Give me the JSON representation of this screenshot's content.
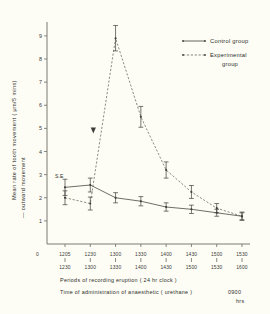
{
  "figure": {
    "background_color": "#fdfdf5",
    "axis_color": "#6b6b66"
  },
  "axes": {
    "y_title_line1": "Mean  rate  of  tooth  movement  (  μm/5  mins)",
    "y_title_line2": "— outward  movement",
    "y_ticks": [
      "1",
      "2",
      "3",
      "4",
      "5",
      "6",
      "7",
      "8",
      "9"
    ],
    "x_origin_label": "0"
  },
  "legend": {
    "position": "top-right",
    "items": [
      {
        "label": "Control  group",
        "style": "solid",
        "color": "#54544f"
      },
      {
        "label": "Experimental",
        "label2": "group",
        "style": "dashed",
        "color": "#6e6e68"
      }
    ]
  },
  "annotations": {
    "se_label": "S.E",
    "arrow_marker": "down-arrow-anaesthetic"
  },
  "caption": {
    "line1": "Periods  of   recording   eruption   ( 24 hr clock )",
    "line2": "Time of     administration  of   anaesthetic  ( urethane )",
    "line2_time": "0900",
    "line2_unit": "hrs"
  },
  "chart_data": {
    "type": "line",
    "title": "",
    "xlabel": "Periods of recording eruption ( 24 hr clock )",
    "ylabel": "Mean rate of tooth movement ( μm/5 mins) — outward movement",
    "ylim": [
      0,
      9.6
    ],
    "grid": false,
    "legend_position": "top-right",
    "categories": [
      "1205\n1230",
      "1230\n1300",
      "1300\n1330",
      "1330\n1400",
      "1400\n1430",
      "1430\n1500",
      "1500\n1530",
      "1530\n1600"
    ],
    "x_tick_top": [
      "1205",
      "1230",
      "1300",
      "1330",
      "1400",
      "1430",
      "1500",
      "1530"
    ],
    "x_tick_bottom": [
      "1230",
      "1300",
      "1330",
      "1400",
      "1430",
      "1500",
      "1530",
      "1600"
    ],
    "series": [
      {
        "name": "Control group",
        "style": "solid",
        "values": [
          2.45,
          2.55,
          2.0,
          1.85,
          1.6,
          1.5,
          1.35,
          1.2
        ],
        "errors": [
          0.35,
          0.3,
          0.22,
          0.2,
          0.18,
          0.18,
          0.15,
          0.15
        ]
      },
      {
        "name": "Experimental group",
        "style": "dashed",
        "values": [
          2.0,
          1.75,
          8.9,
          5.5,
          3.2,
          2.25,
          1.55,
          1.2
        ],
        "errors": [
          0.3,
          0.28,
          0.55,
          0.45,
          0.35,
          0.28,
          0.2,
          0.18
        ]
      }
    ]
  }
}
